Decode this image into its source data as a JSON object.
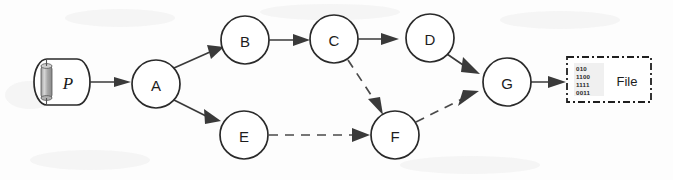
{
  "diagram": {
    "background_color": "#fdfdfd",
    "stroke_color": "#2a2a2a",
    "source": {
      "label": "P",
      "shape": "cylinder",
      "name": "program-source"
    },
    "output": {
      "label": "File",
      "shape": "dash-dot-box",
      "icon": "binary-data-icon",
      "binary_lines": [
        "010",
        "1100",
        "1111",
        "0011"
      ]
    },
    "nodes": [
      {
        "id": "A",
        "label": "A",
        "cx": 156,
        "cy": 84,
        "r": 24
      },
      {
        "id": "B",
        "label": "B",
        "cx": 245,
        "cy": 40,
        "r": 24
      },
      {
        "id": "C",
        "label": "C",
        "cx": 334,
        "cy": 39,
        "r": 24
      },
      {
        "id": "D",
        "label": "D",
        "cx": 430,
        "cy": 38,
        "r": 24
      },
      {
        "id": "E",
        "label": "E",
        "cx": 244,
        "cy": 135,
        "r": 24
      },
      {
        "id": "F",
        "label": "F",
        "cx": 395,
        "cy": 135,
        "r": 24
      },
      {
        "id": "G",
        "label": "G",
        "cx": 507,
        "cy": 82,
        "r": 24
      }
    ],
    "edges": [
      {
        "from": "P",
        "to": "A",
        "style": "solid"
      },
      {
        "from": "A",
        "to": "B",
        "style": "solid"
      },
      {
        "from": "A",
        "to": "E",
        "style": "solid"
      },
      {
        "from": "B",
        "to": "C",
        "style": "solid"
      },
      {
        "from": "C",
        "to": "D",
        "style": "solid"
      },
      {
        "from": "C",
        "to": "F",
        "style": "dashed"
      },
      {
        "from": "E",
        "to": "F",
        "style": "dashed"
      },
      {
        "from": "D",
        "to": "G",
        "style": "solid"
      },
      {
        "from": "F",
        "to": "G",
        "style": "dashed"
      },
      {
        "from": "G",
        "to": "File",
        "style": "solid"
      }
    ]
  }
}
